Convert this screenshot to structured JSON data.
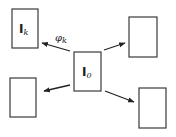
{
  "diagram": {
    "nodes": [
      {
        "id": "I0",
        "label_main": "I",
        "label_sub": "0",
        "role": "center",
        "x": 74,
        "y": 52,
        "w": 27,
        "h": 39
      },
      {
        "id": "Ik",
        "label_main": "I",
        "label_sub": "k",
        "role": "neighbor",
        "x": 12,
        "y": 9,
        "w": 26,
        "h": 39
      },
      {
        "id": "top-right",
        "label_main": "",
        "label_sub": "",
        "role": "neighbor",
        "x": 129,
        "y": 17,
        "w": 28,
        "h": 40
      },
      {
        "id": "bottom-left",
        "label_main": "",
        "label_sub": "",
        "role": "neighbor",
        "x": 10,
        "y": 78,
        "w": 26,
        "h": 39
      },
      {
        "id": "bottom-right",
        "label_main": "",
        "label_sub": "",
        "role": "neighbor",
        "x": 139,
        "y": 88,
        "w": 27,
        "h": 40
      }
    ],
    "edges": [
      {
        "from": "I0",
        "to": "Ik",
        "label_main": "φ",
        "label_sub": "k"
      },
      {
        "from": "I0",
        "to": "top-right",
        "label_main": "",
        "label_sub": ""
      },
      {
        "from": "I0",
        "to": "bottom-left",
        "label_main": "",
        "label_sub": ""
      },
      {
        "from": "I0",
        "to": "bottom-right",
        "label_main": "",
        "label_sub": ""
      }
    ],
    "colors": {
      "stroke": "#3a3a3a",
      "arrow": "#222222",
      "background": "#ffffff"
    }
  }
}
